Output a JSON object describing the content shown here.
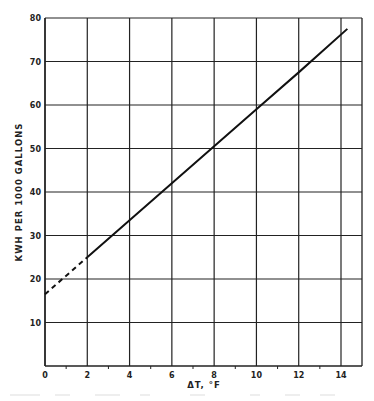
{
  "chart_data": {
    "type": "line",
    "title": "",
    "xlabel": "ΔT, °F",
    "ylabel": "KWH PER 1000 GALLONS",
    "xlim": [
      0,
      15
    ],
    "ylim": [
      0,
      80
    ],
    "x_ticks": [
      "0",
      "2",
      "4",
      "6",
      "8",
      "10",
      "12",
      "14"
    ],
    "y_ticks": [
      "10",
      "20",
      "30",
      "40",
      "50",
      "60",
      "70",
      "80"
    ],
    "grid": true,
    "legend": "none",
    "series": [
      {
        "name": "extrapolated (dashed)",
        "style": "dashed",
        "x": [
          0,
          2
        ],
        "y": [
          16.5,
          25
        ]
      },
      {
        "name": "measured (solid)",
        "style": "solid",
        "x": [
          2,
          4,
          6,
          8,
          10,
          12,
          14.3
        ],
        "y": [
          25,
          33.5,
          42,
          50.5,
          59,
          67.5,
          77.5
        ]
      }
    ]
  }
}
